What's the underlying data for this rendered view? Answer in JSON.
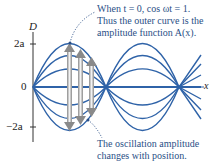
{
  "axes": {
    "y_label": "D",
    "x_label": "x",
    "ticks": [
      {
        "label": "2a",
        "value": "2a"
      },
      {
        "label": "0",
        "value": "0"
      },
      {
        "label": "−2a",
        "value": "-2a"
      }
    ]
  },
  "annotations": {
    "top": {
      "line1": "When t = 0, cos ωt = 1.",
      "line2": "Thus the outer curve is the",
      "line3": "amplitude function A(x)."
    },
    "bottom": {
      "line1": "The oscillation amplitude",
      "line2": "changes with position."
    }
  },
  "colors": {
    "curve": "#2f63a8",
    "annotation_text": "#2a4f86",
    "axis": "#333333",
    "arrow": "#9a9a9a"
  }
}
